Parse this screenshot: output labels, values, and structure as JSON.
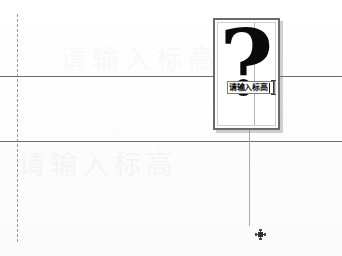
{
  "canvas": {
    "width": 342,
    "height": 256,
    "background_color": "#fefefe",
    "description": "CAD drawing canvas with inline text entry"
  },
  "watermark": {
    "upper_text": "请输入标高",
    "lower_text": "请输入标高",
    "color": "#f4f4f4"
  },
  "guides": {
    "dashed_vertical_label": "dashed construction guide",
    "horizontal_line_1_label": "horizontal datum line",
    "horizontal_line_2_label": "horizontal datum line",
    "vertical_thin_label": "vertical construction line",
    "line_color": "#6e6e6e",
    "dashed_color": "#9a9a9a"
  },
  "panel": {
    "glyph": "?",
    "glyph_color": "#0a0a0a",
    "border_color": "#6a6a6a",
    "background_color": "#ffffff"
  },
  "inline_input": {
    "value": "请输入标高",
    "placeholder": "请输入标高",
    "border_color": "#7d7d7d",
    "text_color": "#0b0b0b"
  },
  "snap_marker": {
    "label": "node snap marker",
    "color": "#2f2f2f"
  }
}
